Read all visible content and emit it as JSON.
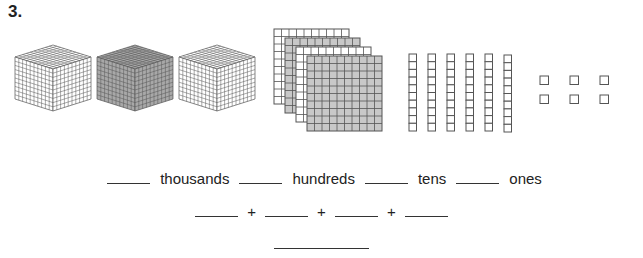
{
  "problem": {
    "number": "3."
  },
  "blocks": {
    "thousands_cubes": [
      {
        "shade": "light"
      },
      {
        "shade": "dark"
      },
      {
        "shade": "light"
      }
    ],
    "hundreds_flats": [
      {
        "shade": "white"
      },
      {
        "shade": "gray"
      },
      {
        "shade": "white"
      },
      {
        "shade": "gray"
      }
    ],
    "tens_rods": 6,
    "ones_units": 6,
    "colors": {
      "line": "#555555",
      "gray_fill": "#c8c8c8",
      "dark_cube": "#a8a8a8",
      "white": "#ffffff"
    }
  },
  "place_value_row": {
    "labels": [
      "thousands",
      "hundreds",
      "tens",
      "ones"
    ]
  },
  "expanded_form_row": {
    "operators": [
      "+",
      "+",
      "+"
    ]
  }
}
